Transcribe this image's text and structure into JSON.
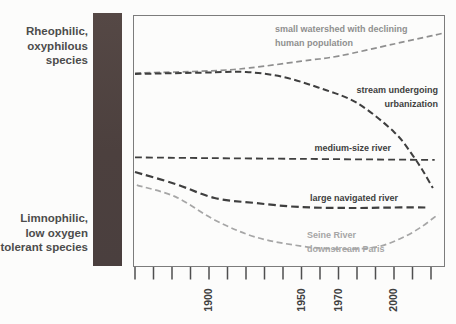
{
  "left_panel": {
    "top_label": {
      "lines": [
        "Rheophilic,",
        "oxyphilous",
        "species"
      ]
    },
    "bottom_label": {
      "lines": [
        "Limnophilic,",
        "low oxygen",
        "tolerant species"
      ]
    },
    "gradient_bar_color": "#4e4341"
  },
  "chart_data": {
    "type": "line",
    "title": "",
    "xlabel": "",
    "ylabel": "",
    "y_axis_qualitative": {
      "top": "Rheophilic, oxyphilous species",
      "bottom": "Limnophilic, low oxygen tolerant species",
      "scale_note": "relative index 0-100, 100 = rheophilic (top)"
    },
    "x_axis": {
      "tick_year_start": 1860,
      "tick_year_end": 2020,
      "tick_step": 10,
      "labeled_ticks": [
        "1900",
        "1950",
        "1970",
        "2000"
      ]
    },
    "grid": false,
    "legend": "inline annotations on curves",
    "line_style": "dashed",
    "series": [
      {
        "name": "small-watershed",
        "label_lines": [
          "small watershed with declining",
          "human population"
        ],
        "color": "#8f8f8f",
        "years": [
          1860,
          1900,
          1922,
          1950,
          1970,
          2000,
          2020,
          2027
        ],
        "values": [
          77.0,
          77.8,
          79.0,
          81.7,
          83.7,
          88.5,
          91.7,
          92.9
        ]
      },
      {
        "name": "stream-urbanization",
        "label_lines": [
          "stream undergoing",
          "urbanization"
        ],
        "color": "#3f3f3f",
        "years": [
          1860,
          1900,
          1920,
          1940,
          1960,
          1980,
          2000,
          2010,
          2016,
          2021
        ],
        "values": [
          76.6,
          77.2,
          77.4,
          75.4,
          71.0,
          65.1,
          53.6,
          44.4,
          37.7,
          31.3
        ]
      },
      {
        "name": "medium-size-river",
        "label_lines": [
          "medium-size river"
        ],
        "color": "#3f3f3f",
        "years": [
          1860,
          1900,
          1950,
          2000,
          2022
        ],
        "values": [
          43.5,
          43.2,
          42.9,
          42.6,
          42.5
        ]
      },
      {
        "name": "large-navigated-river",
        "label_lines": [
          "large navigated river"
        ],
        "color": "#3f3f3f",
        "years": [
          1860,
          1882,
          1903,
          1925,
          1949,
          1976,
          2000,
          2018
        ],
        "values": [
          37.7,
          32.9,
          27.4,
          25.4,
          23.8,
          23.4,
          23.6,
          23.6
        ]
      },
      {
        "name": "seine-river",
        "label_lines": [
          "Seine River",
          "downstream Paris"
        ],
        "color": "#a6a6a6",
        "years": [
          1861,
          1882,
          1903,
          1925,
          1950,
          1971,
          1990,
          2003,
          2014,
          2024
        ],
        "values": [
          32.5,
          27.8,
          18.7,
          11.9,
          8.3,
          7.1,
          7.9,
          11.1,
          15.5,
          21.0
        ]
      }
    ]
  }
}
